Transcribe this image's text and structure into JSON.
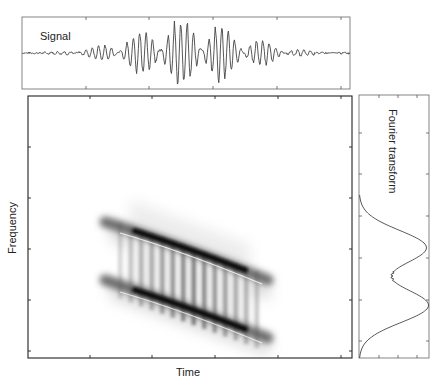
{
  "figure": {
    "signal_panel": {
      "title": "Signal"
    },
    "main_panel": {
      "xlabel": "Time",
      "ylabel": "Frequency"
    },
    "fourier_panel": {
      "title": "Fourier transform"
    }
  },
  "colors": {
    "axis": "#333333",
    "line": "#444444",
    "ink": "#111111",
    "background": "#ffffff"
  },
  "chart_data": [
    {
      "type": "line",
      "title": "Signal",
      "xlabel": "",
      "ylabel": "",
      "description": "Oscillating signal with Gaussian envelope; amplitude peaks near center of time axis",
      "x_ticks_count": 5,
      "envelope": {
        "center_frac": 0.51,
        "width_frac": 0.16,
        "peak_amplitude_frac": 0.95
      },
      "grid": false
    },
    {
      "type": "heatmap",
      "title": "",
      "xlabel": "Time",
      "ylabel": "Frequency",
      "description": "Wigner-Ville style time-frequency distribution of two parallel chirp components with interference terms between them",
      "components": [
        {
          "name": "upper chirp",
          "t_start_frac": 0.24,
          "f_start_frac": 0.53,
          "t_end_frac": 0.73,
          "f_end_frac": 0.3
        },
        {
          "name": "lower chirp",
          "t_start_frac": 0.24,
          "f_start_frac": 0.29,
          "t_end_frac": 0.73,
          "f_end_frac": 0.06
        }
      ],
      "interference_stripes": 10,
      "x_ticks_count": 5,
      "y_ticks_count": 5,
      "grid": false
    },
    {
      "type": "line",
      "title": "Fourier transform",
      "orientation": "vertical",
      "description": "Spectrum magnitude vs frequency with two peaks",
      "peaks": [
        {
          "freq_frac": 0.42,
          "amplitude_frac": 0.96
        },
        {
          "freq_frac": 0.2,
          "amplitude_frac": 0.99
        }
      ],
      "dip": {
        "freq_frac": 0.31,
        "amplitude_frac": 0.24
      },
      "grid": false
    }
  ]
}
